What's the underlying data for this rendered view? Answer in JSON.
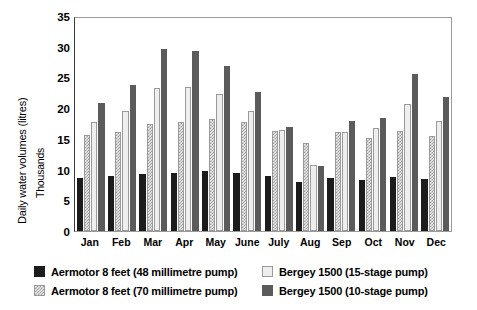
{
  "chart_data": {
    "type": "bar",
    "title": "",
    "xlabel": "",
    "ylabel": "Daily water volumes (litres)",
    "ylabel_secondary": "Thousands",
    "ylim": [
      0,
      35
    ],
    "yticks": [
      0,
      5,
      10,
      15,
      20,
      25,
      30,
      35
    ],
    "grid": false,
    "legend_position": "bottom",
    "categories": [
      "Jan",
      "Feb",
      "Mar",
      "Apr",
      "May",
      "June",
      "July",
      "Aug",
      "Sep",
      "Oct",
      "Nov",
      "Dec"
    ],
    "series": [
      {
        "name": "Aermotor 8 feet (48 millimetre pump)",
        "color": "#1c1c1c",
        "pattern": "solid",
        "values": [
          8.6,
          8.9,
          9.3,
          9.5,
          9.7,
          9.5,
          8.9,
          8.0,
          8.7,
          8.3,
          8.8,
          8.4
        ]
      },
      {
        "name": "Aermotor 8 feet (70 millimetre pump)",
        "color": "#e9e9e9",
        "pattern": "hatch",
        "values": [
          15.6,
          16.2,
          17.5,
          17.7,
          18.3,
          17.8,
          16.3,
          14.3,
          16.1,
          15.2,
          16.3,
          15.4
        ]
      },
      {
        "name": "Bergey 1500 (15-stage pump)",
        "color": "#eeeeee",
        "pattern": "solid-light",
        "values": [
          17.7,
          19.5,
          23.3,
          23.4,
          22.3,
          19.5,
          16.5,
          10.7,
          16.2,
          16.7,
          20.6,
          17.9
        ]
      },
      {
        "name": "Bergey 1500 (10-stage pump)",
        "color": "#5b5b5b",
        "pattern": "solid",
        "values": [
          20.8,
          23.7,
          29.6,
          29.3,
          26.9,
          22.6,
          16.9,
          10.6,
          17.9,
          18.4,
          25.5,
          21.8
        ]
      }
    ]
  },
  "axis": {
    "y_title_main": "Daily water volumes (litres)",
    "y_title_sub": "Thousands"
  }
}
